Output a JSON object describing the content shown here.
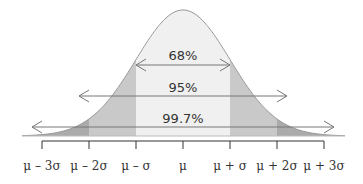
{
  "chart_data": {
    "type": "area",
    "title": "",
    "xlabel": "",
    "ylabel": "",
    "xlim": [
      -3.3,
      3.3
    ],
    "x_ticks": [
      -3,
      -2,
      -1,
      0,
      1,
      2,
      3
    ],
    "tick_labels": [
      "μ – 3σ",
      "μ – 2σ",
      "μ – σ",
      "μ",
      "μ + σ",
      "μ + 2σ",
      "μ + 3σ"
    ],
    "regions": [
      {
        "name": "within-1-sigma",
        "from": -1,
        "to": 1,
        "color": "#f0f0f0"
      },
      {
        "name": "1-to-2-sigma",
        "from": 1,
        "to": 2,
        "color": "#c9c9c9"
      },
      {
        "name": "2-to-3-sigma",
        "from": 2,
        "to": 3,
        "color": "#ababab"
      },
      {
        "name": "tails",
        "from": 3,
        "to": 3.3,
        "color": "#ababab"
      }
    ],
    "intervals": [
      {
        "label": "68%",
        "from": -1,
        "to": 1
      },
      {
        "label": "95%",
        "from": -2,
        "to": 2
      },
      {
        "label": "99.7%",
        "from": -3,
        "to": 3
      }
    ],
    "grid": false,
    "legend": "none",
    "colors": {
      "curve": "#999999",
      "arrow": "#777777",
      "axis": "#333333"
    }
  }
}
